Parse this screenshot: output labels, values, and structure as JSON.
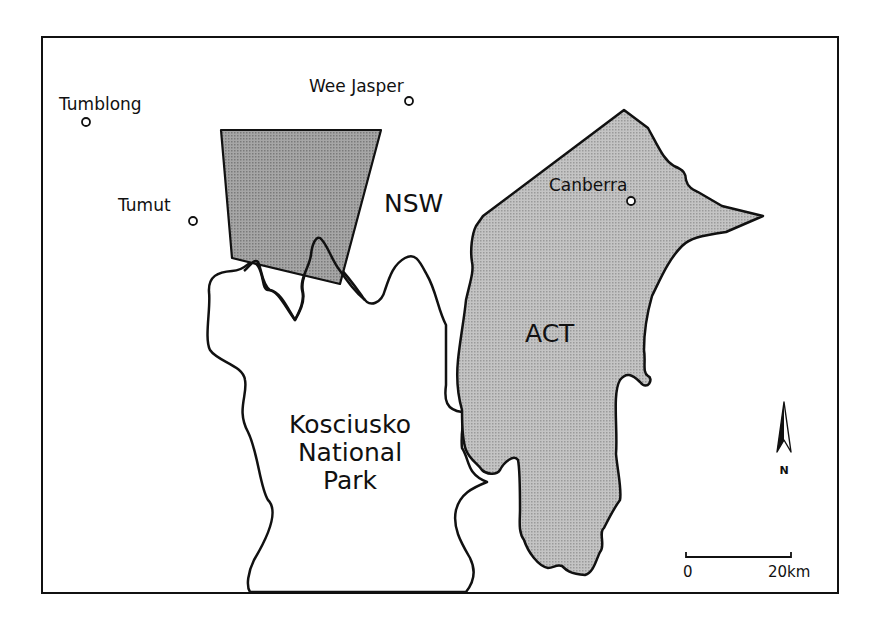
{
  "map": {
    "title": "",
    "colors": {
      "background": "#ffffff",
      "outline": "#111111",
      "pine_forest_fill": "#9a9a9a",
      "act_fill": "#b9b9b9"
    },
    "towns": [
      {
        "name": "Tumblong",
        "label": "Tumblong"
      },
      {
        "name": "Wee Jasper",
        "label": "Wee Jasper"
      },
      {
        "name": "Tumut",
        "label": "Tumut"
      },
      {
        "name": "Canberra",
        "label": "Canberra"
      }
    ],
    "regions": {
      "nsw": "NSW",
      "act": "ACT",
      "park_line1": "Kosciusko",
      "park_line2": "National",
      "park_line3": "Park"
    },
    "north_arrow": {
      "label": "N",
      "icon": "north-arrow-icon"
    },
    "scale_bar": {
      "start_label": "0",
      "end_label": "20km"
    }
  }
}
